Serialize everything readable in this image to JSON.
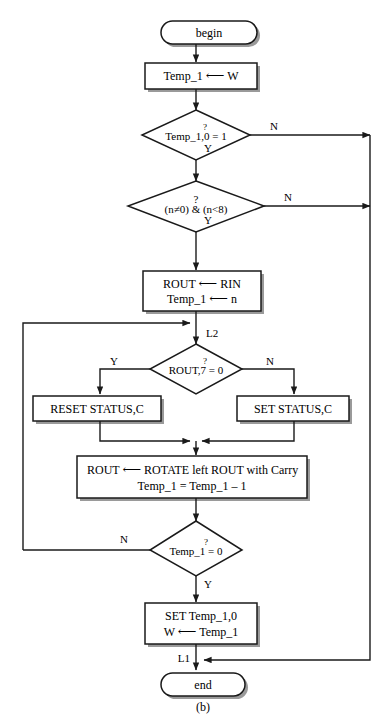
{
  "diagram": {
    "caption": "(b)",
    "colors": {
      "stroke": "#1a1a1a",
      "fill": "#ffffff",
      "text": "#000000",
      "shadow": "#8c8c8c"
    },
    "nodes": {
      "begin": {
        "label": "begin",
        "shape": "terminal"
      },
      "init_temp": {
        "label": "Temp_1",
        "arrow": "⟵",
        "operand": "W",
        "shape": "process"
      },
      "dec_temp_bit": {
        "line1": "Temp_1,0",
        "op": "=",
        "operand": "1",
        "qmark": "?",
        "shape": "decision"
      },
      "dec_range": {
        "line1": "?",
        "line2": "(n≠0) & (n<8)",
        "shape": "decision"
      },
      "load_rout": {
        "row1_left": "ROUT",
        "row1_arrow": "⟵",
        "row1_right": "RIN",
        "row2_left": "Temp_1",
        "row2_arrow": "⟵",
        "row2_right": "n",
        "shape": "process"
      },
      "dec_rout7": {
        "line1": "ROUT,7",
        "op": "=",
        "operand": "0",
        "qmark": "?",
        "shape": "decision"
      },
      "reset_status": {
        "label": "RESET  STATUS,C",
        "shape": "process"
      },
      "set_status": {
        "label": "SET STATUS,C",
        "shape": "process"
      },
      "rotate": {
        "row1_left": "ROUT",
        "row1_arrow": "⟵",
        "row1_right": "ROTATE left ROUT with Carry",
        "row2": "Temp_1 = Temp_1 – 1",
        "shape": "process"
      },
      "dec_temp_zero": {
        "line1": "Temp_1",
        "op": "=",
        "operand": "0",
        "qmark": "?",
        "shape": "decision"
      },
      "set_temp": {
        "row1": "SET  Temp_1,0",
        "row2_left": "W",
        "row2_arrow": "⟵",
        "row2_right": "Temp_1",
        "shape": "process"
      },
      "end": {
        "label": "end",
        "shape": "terminal"
      }
    },
    "edge_labels": {
      "temp_bit_no": "N",
      "temp_bit_yes": "Y",
      "range_no": "N",
      "range_yes": "Y",
      "rout7_yes": "Y",
      "rout7_no": "N",
      "temp_zero_no": "N",
      "temp_zero_yes": "Y"
    },
    "connectors": {
      "loop_top": "L2",
      "exit_join": "L1"
    }
  }
}
